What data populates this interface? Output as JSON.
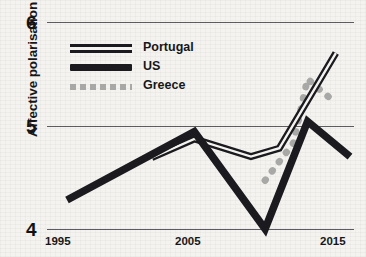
{
  "chart_data": {
    "type": "line",
    "title": "",
    "xlabel": "",
    "ylabel": "Affective polarisation",
    "xlim": [
      1994,
      2016
    ],
    "ylim": [
      4,
      6
    ],
    "yticks": [
      "4",
      "5",
      "6"
    ],
    "xticks": [
      "1995",
      "2005",
      "2015"
    ],
    "grid": "horizontal",
    "legend_position": "top-left",
    "series": [
      {
        "name": "Portugal",
        "style": "double-line",
        "color": "#1b1b1f",
        "points": [
          {
            "x": 2002,
            "y": 4.69
          },
          {
            "x": 2005,
            "y": 4.87
          },
          {
            "x": 2009,
            "y": 4.7
          },
          {
            "x": 2011,
            "y": 4.78
          },
          {
            "x": 2015,
            "y": 5.7
          }
        ]
      },
      {
        "name": "US",
        "style": "thick-line",
        "color": "#1b1b1f",
        "points": [
          {
            "x": 1996,
            "y": 4.28
          },
          {
            "x": 2005,
            "y": 4.94
          },
          {
            "x": 2010,
            "y": 4.0
          },
          {
            "x": 2013,
            "y": 5.04
          },
          {
            "x": 2016,
            "y": 4.7
          }
        ]
      },
      {
        "name": "Greece",
        "style": "dotted-line",
        "color": "#a8a8a6",
        "points": [
          {
            "x": 2010,
            "y": 4.47
          },
          {
            "x": 2012,
            "y": 4.83
          },
          {
            "x": 2013,
            "y": 5.45
          },
          {
            "x": 2014,
            "y": 5.33
          },
          {
            "x": 2015,
            "y": 5.22
          }
        ]
      }
    ]
  },
  "axis": {
    "y_label": "Affective polarisation",
    "y_tick_top": "6",
    "y_tick_mid": "5",
    "y_tick_bottom": "4",
    "x_tick_left": "1995",
    "x_tick_mid": "2005",
    "x_tick_right": "2015"
  },
  "legend": {
    "items": [
      {
        "label": "Portugal",
        "key": "double-line-key"
      },
      {
        "label": "US",
        "key": "thick-line-key"
      },
      {
        "label": "Greece",
        "key": "dotted-line-key"
      }
    ]
  }
}
